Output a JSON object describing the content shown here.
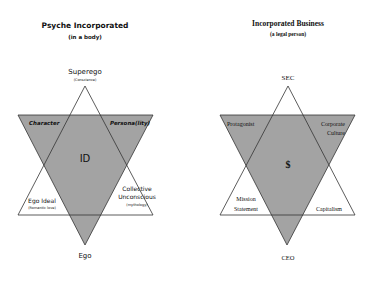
{
  "colors": {
    "shade": "#a3a3a3",
    "line": "#333333",
    "text": "#111111"
  },
  "left": {
    "title": "Psyche Incorporated",
    "subtitle": "(in a body)",
    "top_label": "Superego",
    "top_sub": "(Conscience)",
    "bottom_label": "Ego",
    "center_label": "ID",
    "upper_left": "Character",
    "upper_right": "Persona(lity)",
    "lower_left": "Ego Ideal",
    "lower_left_sub": "(Romantic love)",
    "lower_right_1": "Collective",
    "lower_right_2": "Unconscious",
    "lower_right_sub": "(mythology)"
  },
  "right": {
    "title": "Incorporated Business",
    "subtitle": "(a legal person)",
    "top_label": "SEC",
    "bottom_label": "CEO",
    "center_label": "$",
    "upper_left": "Protagonist",
    "upper_right_1": "Corporate",
    "upper_right_2": "Culture",
    "lower_left_1": "Mission",
    "lower_left_2": "Statement",
    "lower_right": "Capitalism"
  }
}
